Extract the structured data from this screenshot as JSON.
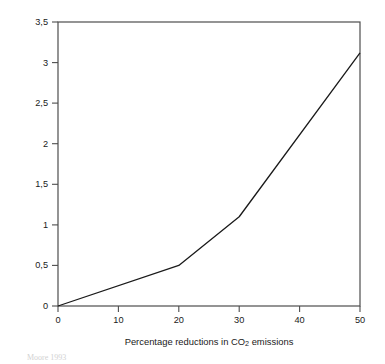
{
  "chart_data": {
    "type": "line",
    "title": "",
    "xlabel_prefix": "Percentage reductions in CO",
    "xlabel_sub": "2",
    "xlabel_suffix": " emissions",
    "xlabel": "Percentage reductions in CO2 emissions",
    "ylabel": "Percentage reductions in GNF",
    "xlim": [
      0,
      50
    ],
    "ylim": [
      0,
      3.5
    ],
    "grid": false,
    "legend": "none",
    "decimal_separator": ",",
    "xticks": [
      0,
      10,
      20,
      30,
      40,
      50
    ],
    "xtick_labels": [
      "0",
      "10",
      "20",
      "30",
      "40",
      "50"
    ],
    "yticks": [
      0,
      0.5,
      1,
      1.5,
      2,
      2.5,
      3,
      3.5
    ],
    "ytick_labels": [
      "0",
      "0,5",
      "1",
      "1,5",
      "2",
      "2,5",
      "3",
      "3,5"
    ],
    "series": [
      {
        "name": "GNF reduction",
        "color": "#1a1a1a",
        "x": [
          0,
          20,
          30,
          50
        ],
        "y": [
          0,
          0.5,
          1.1,
          3.12
        ]
      }
    ]
  },
  "figure": {
    "source_note": "Moore 1993"
  },
  "colors": {
    "axis": "#4d4d4d",
    "line": "#1a1a1a",
    "text": "#1a1a1a",
    "background": "#ffffff"
  }
}
